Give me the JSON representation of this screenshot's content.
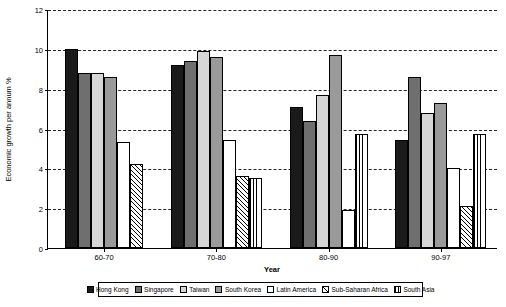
{
  "chart_data": {
    "type": "bar",
    "title": "",
    "xlabel": "Year",
    "ylabel": "Economic growth per annum %",
    "categories": [
      "60-70",
      "70-80",
      "80-90",
      "90-97"
    ],
    "ylim": [
      0,
      12
    ],
    "yticks": [
      0,
      2,
      4,
      6,
      8,
      10,
      12
    ],
    "ytick_labels": [
      "0",
      "2",
      "4",
      "6",
      "8",
      "10",
      "12"
    ],
    "grid": true,
    "legend_position": "bottom",
    "series": [
      {
        "name": "Hong Kong",
        "fill": "solid-black",
        "color": "#1a1a1a",
        "values": [
          10.0,
          9.2,
          7.1,
          5.4
        ]
      },
      {
        "name": "Singapore",
        "fill": "dark-gray",
        "color": "#6f6f6f",
        "values": [
          8.8,
          9.4,
          6.4,
          8.6
        ]
      },
      {
        "name": "Taiwan",
        "fill": "light-gray",
        "color": "#d6d6d6",
        "values": [
          8.8,
          9.9,
          7.7,
          6.8
        ]
      },
      {
        "name": "South Korea",
        "fill": "mid-gray",
        "color": "#9a9a9a",
        "values": [
          8.6,
          9.6,
          9.7,
          7.3
        ]
      },
      {
        "name": "Latin America",
        "fill": "white",
        "color": "#ffffff",
        "values": [
          5.3,
          5.4,
          1.9,
          4.0
        ]
      },
      {
        "name": "Sub-Saharan Africa",
        "fill": "hatch",
        "color": "#ffffff",
        "values": [
          4.2,
          3.6,
          0.0,
          2.1
        ]
      },
      {
        "name": "South Asia",
        "fill": "vlines",
        "color": "#ffffff",
        "values": [
          0.0,
          3.5,
          5.7,
          5.7
        ]
      }
    ]
  }
}
